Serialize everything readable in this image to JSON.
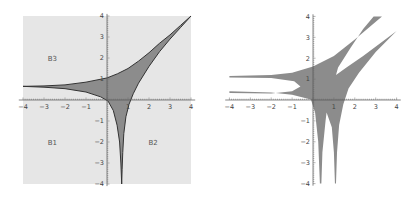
{
  "chart_data": [
    {
      "type": "area",
      "title": "",
      "xlabel": "",
      "ylabel": "",
      "xlim": [
        -4,
        4
      ],
      "ylim": [
        -4,
        4
      ],
      "x_ticks": [
        "-4",
        "-3",
        "-2",
        "-1",
        "",
        "1",
        "2",
        "3",
        "4"
      ],
      "y_ticks": [
        "4",
        "3",
        "2",
        "1",
        "",
        "-1",
        "-2",
        "-3",
        "-4"
      ],
      "grid": false,
      "background_color": "#e6e6e6",
      "fill_color": "#8c8c8c",
      "edge_color": "#333333",
      "region_labels": [
        {
          "text": "B3",
          "x": -2.6,
          "y": 2.0
        },
        {
          "text": "B1",
          "x": -2.6,
          "y": -2.0
        },
        {
          "text": "B2",
          "x": 2.2,
          "y": -2.0
        }
      ],
      "boundary": {
        "upper": [
          [
            -4,
            0.65
          ],
          [
            -3,
            0.67
          ],
          [
            -2,
            0.72
          ],
          [
            -1,
            0.85
          ],
          [
            0,
            1.05
          ],
          [
            0.5,
            1.25
          ],
          [
            1,
            1.5
          ],
          [
            1.5,
            1.85
          ],
          [
            2,
            2.25
          ],
          [
            2.5,
            2.7
          ],
          [
            3,
            3.1
          ],
          [
            3.5,
            3.55
          ],
          [
            4,
            4.0
          ]
        ],
        "right": [
          [
            4,
            4.0
          ],
          [
            3.5,
            3.45
          ],
          [
            3,
            2.9
          ],
          [
            2.5,
            2.3
          ],
          [
            2,
            1.6
          ],
          [
            1.5,
            0.8
          ],
          [
            1.25,
            0.3
          ],
          [
            1.05,
            -0.2
          ],
          [
            0.9,
            -0.8
          ],
          [
            0.8,
            -1.6
          ],
          [
            0.75,
            -2.5
          ],
          [
            0.72,
            -3.3
          ],
          [
            0.7,
            -4.0
          ]
        ],
        "lower_left_branch": [
          [
            0.7,
            -4.0
          ],
          [
            0.66,
            -3.0
          ],
          [
            0.6,
            -2.0
          ],
          [
            0.48,
            -1.2
          ],
          [
            0.3,
            -0.5
          ],
          [
            0.05,
            -0.05
          ]
        ],
        "lower": [
          [
            0.05,
            -0.05
          ],
          [
            -0.3,
            0.15
          ],
          [
            -1,
            0.38
          ],
          [
            -2,
            0.54
          ],
          [
            -3,
            0.61
          ],
          [
            -4,
            0.65
          ]
        ]
      }
    },
    {
      "type": "area",
      "title": "",
      "xlabel": "",
      "ylabel": "",
      "xlim": [
        -4,
        4
      ],
      "ylim": [
        -4,
        4
      ],
      "x_ticks": [
        "-4",
        "-3",
        "-2",
        "-1",
        "",
        "1",
        "2",
        "3",
        "4"
      ],
      "y_ticks": [
        "4",
        "3",
        "2",
        "1",
        "",
        "-1",
        "-2",
        "-3",
        "-4"
      ],
      "grid": false,
      "background_color": "#ffffff",
      "fill_color": "#8c8c8c",
      "boundary": [
        [
          -4,
          1.15
        ],
        [
          -2,
          1.2
        ],
        [
          -1,
          1.3
        ],
        [
          0,
          1.6
        ],
        [
          1,
          2.1
        ],
        [
          2,
          2.9
        ],
        [
          3.3,
          4.0
        ],
        [
          2.9,
          4.0
        ],
        [
          2.4,
          3.4
        ],
        [
          1.8,
          2.5
        ],
        [
          1.2,
          1.55
        ],
        [
          1.1,
          1.2
        ],
        [
          1.6,
          1.55
        ],
        [
          2.4,
          2.1
        ],
        [
          3.2,
          2.7
        ],
        [
          4,
          3.3
        ],
        [
          3.7,
          3.0
        ],
        [
          3,
          2.3
        ],
        [
          2.2,
          1.3
        ],
        [
          1.7,
          0.55
        ],
        [
          1.45,
          -0.2
        ],
        [
          1.25,
          -1.2
        ],
        [
          1.15,
          -2.5
        ],
        [
          1.1,
          -4.0
        ],
        [
          1.05,
          -4.0
        ],
        [
          1.0,
          -2.5
        ],
        [
          0.9,
          -1.3
        ],
        [
          0.65,
          -0.6
        ],
        [
          0.6,
          -1.0
        ],
        [
          0.45,
          -2.5
        ],
        [
          0.4,
          -4.0
        ],
        [
          0.33,
          -4.0
        ],
        [
          0.25,
          -2.0
        ],
        [
          0.1,
          -0.6
        ],
        [
          -0.1,
          0.02
        ],
        [
          -1,
          0.25
        ],
        [
          -2,
          0.36
        ],
        [
          -4,
          0.42
        ],
        [
          -4,
          0.34
        ],
        [
          -2,
          0.31
        ],
        [
          -1,
          0.42
        ],
        [
          -0.6,
          0.65
        ],
        [
          -0.9,
          0.9
        ],
        [
          -2,
          1.05
        ],
        [
          -4,
          1.08
        ]
      ]
    }
  ],
  "left_plot": {
    "region_labels": [
      "B3",
      "B1",
      "B2"
    ]
  }
}
